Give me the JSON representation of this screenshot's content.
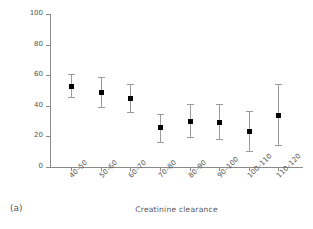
{
  "panel": {
    "letter": "(a)"
  },
  "chart_data": {
    "type": "scatter",
    "title": "",
    "xlabel": "Creatinine clearance",
    "ylabel": "30-day mortality",
    "categories": [
      "40–50",
      "50–60",
      "60–70",
      "70–80",
      "80–90",
      "90–100",
      "100–110",
      "110–120"
    ],
    "values": [
      53,
      49,
      45,
      26,
      30,
      29.5,
      23.5,
      34
    ],
    "error_low": [
      45.5,
      39.5,
      36,
      16.5,
      19.5,
      18.5,
      10.5,
      14.5
    ],
    "error_high": [
      60.5,
      59,
      54,
      34.5,
      41,
      41,
      36.5,
      54.5
    ],
    "ylim": [
      0,
      100
    ],
    "yticks": [
      0,
      20,
      40,
      60,
      80,
      100
    ],
    "ytick_labels": [
      "0",
      "20",
      "40",
      "60",
      "80",
      "100"
    ],
    "grid": false,
    "legend": "none",
    "marker": "filled-square",
    "marker_color": "#000000",
    "errorbar_color": "#9b9b9b"
  }
}
